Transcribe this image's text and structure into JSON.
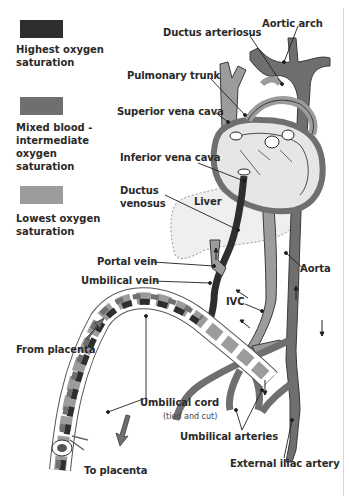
{
  "colors": {
    "highest": "#2e2e2e",
    "mixed": "#6f6f6f",
    "lowest": "#9c9c9c",
    "chamber_fill": "#e4e4e4",
    "outline": "#3a3a3a",
    "leader": "#1e1e1e"
  },
  "legend": [
    {
      "label": "Highest oxygen saturation",
      "color": "#2e2e2e"
    },
    {
      "label": "Mixed blood - intermediate oxygen saturation",
      "color": "#6f6f6f"
    },
    {
      "label": "Lowest oxygen saturation",
      "color": "#9c9c9c"
    }
  ],
  "labels": {
    "aortic_arch": "Aortic arch",
    "ductus_arteriosus": "Ductus arteriosus",
    "pulmonary_trunk": "Pulmonary trunk",
    "superior_vena_cava": "Superior vena cava",
    "inferior_vena_cava": "Inferior vena cava",
    "ductus_venosus_1": "Ductus",
    "ductus_venosus_2": "venosus",
    "liver": "Liver",
    "portal_vein": "Portal vein",
    "umbilical_vein": "Umbilical vein",
    "aorta": "Aorta",
    "ivc": "IVC",
    "from_placenta": "From placenta",
    "umbilical_cord": "Umbilical cord",
    "umbilical_cord_note": "(tied and cut)",
    "umbilical_arteries": "Umbilical arteries",
    "to_placenta": "To placenta",
    "external_iliac_artery": "External iliac artery"
  }
}
